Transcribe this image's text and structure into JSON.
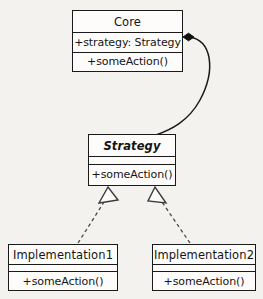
{
  "diagram": {
    "background_color": "#f4f2ef",
    "line_color": "#1a1a1a",
    "box_fill_color": "#fdfcfa",
    "classes": [
      {
        "id": "core",
        "name": "Core",
        "abstract": false,
        "attributes": "+strategy: Strategy",
        "operations": "+someAction()"
      },
      {
        "id": "strategy",
        "name": "Strategy",
        "abstract": true,
        "attributes": "",
        "operations": "+someAction()"
      },
      {
        "id": "impl1",
        "name": "Implementation1",
        "abstract": false,
        "attributes": "",
        "operations": "+someAction()"
      },
      {
        "id": "impl2",
        "name": "Implementation2",
        "abstract": false,
        "attributes": "",
        "operations": "+someAction()"
      }
    ],
    "relationships": [
      {
        "id": "core-strategy",
        "type": "composition",
        "from": "Core",
        "to": "Strategy",
        "line_style": "solid-curved",
        "source_decoration": "filled-diamond",
        "target_decoration": "none"
      },
      {
        "id": "impl1-strategy",
        "type": "realization",
        "from": "Implementation1",
        "to": "Strategy",
        "line_style": "dashed",
        "source_decoration": "none",
        "target_decoration": "hollow-triangle"
      },
      {
        "id": "impl2-strategy",
        "type": "realization",
        "from": "Implementation2",
        "to": "Strategy",
        "line_style": "dashed",
        "source_decoration": "none",
        "target_decoration": "hollow-triangle"
      }
    ]
  }
}
